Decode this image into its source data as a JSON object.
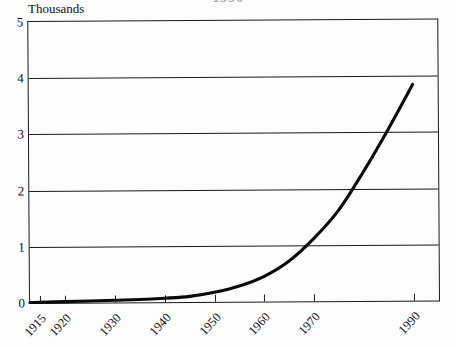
{
  "title": {
    "text": "1990",
    "note": "cropped-at-top"
  },
  "axes": {
    "y_caption": "Thousands",
    "y_ticks": [
      "0",
      "1",
      "2",
      "3",
      "4",
      "5"
    ],
    "y_values": [
      0,
      1,
      2,
      3,
      4,
      5
    ],
    "x_ticks": [
      "1915",
      "1920",
      "1930",
      "1940",
      "1950",
      "1960",
      "1970",
      "1990"
    ],
    "x_values": [
      1915,
      1920,
      1930,
      1940,
      1950,
      1960,
      1970,
      1990
    ]
  },
  "colors": {
    "curve": "#090909",
    "frame": "#1a1a1a",
    "grid": "#1a1a1a",
    "background": "#fdfdfd",
    "title": "#4a4a52"
  },
  "chart_data": {
    "type": "line",
    "title": "1990",
    "xlabel": "",
    "ylabel": "Thousands",
    "xlim": [
      1913,
      1995
    ],
    "ylim": [
      0,
      5
    ],
    "grid": true,
    "legend": "none",
    "x_tick_labels": [
      "1915",
      "1920",
      "1930",
      "1940",
      "1950",
      "1960",
      "1970",
      "1990"
    ],
    "x_tick_values": [
      1915,
      1920,
      1930,
      1940,
      1950,
      1960,
      1970,
      1990
    ],
    "y_tick_labels": [
      "0",
      "1",
      "2",
      "3",
      "4",
      "5"
    ],
    "y_tick_values": [
      0,
      1,
      2,
      3,
      4,
      5
    ],
    "series": [
      {
        "name": "count",
        "x": [
          1913,
          1915,
          1920,
          1925,
          1930,
          1935,
          1940,
          1945,
          1950,
          1955,
          1960,
          1965,
          1970,
          1975,
          1980,
          1985,
          1990
        ],
        "values": [
          0.01,
          0.01,
          0.02,
          0.03,
          0.04,
          0.05,
          0.07,
          0.1,
          0.17,
          0.28,
          0.45,
          0.72,
          1.12,
          1.62,
          2.3,
          3.05,
          3.85
        ]
      }
    ],
    "annotations": []
  }
}
